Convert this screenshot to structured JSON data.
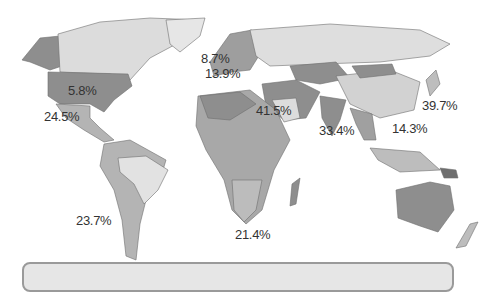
{
  "map": {
    "type": "choropleth-world",
    "color_scheme": "grayscale",
    "colors": {
      "ocean": "#ffffff",
      "light": "#dcdcdc",
      "mid": "#b4b4b4",
      "dark": "#8e8e8e",
      "darker": "#767676",
      "border": "#6e6e6e"
    },
    "labels": [
      {
        "id": "usa",
        "text": "5.8%",
        "x": 68,
        "y": 84
      },
      {
        "id": "mexico",
        "text": "24.5%",
        "x": 44,
        "y": 110
      },
      {
        "id": "northern-europe",
        "text": "8.7%",
        "x": 201,
        "y": 52
      },
      {
        "id": "western-europe",
        "text": "13.9%",
        "x": 205,
        "y": 67
      },
      {
        "id": "middle-east",
        "text": "41.5%",
        "x": 256,
        "y": 104
      },
      {
        "id": "south-asia",
        "text": "33.4%",
        "x": 319,
        "y": 124
      },
      {
        "id": "southeast-asia",
        "text": "14.3%",
        "x": 392,
        "y": 122
      },
      {
        "id": "east-asia",
        "text": "39.7%",
        "x": 422,
        "y": 99
      },
      {
        "id": "south-america",
        "text": "23.7%",
        "x": 76,
        "y": 214
      },
      {
        "id": "africa",
        "text": "21.4%",
        "x": 235,
        "y": 228
      }
    ]
  },
  "legend": {
    "visible_text": ""
  }
}
